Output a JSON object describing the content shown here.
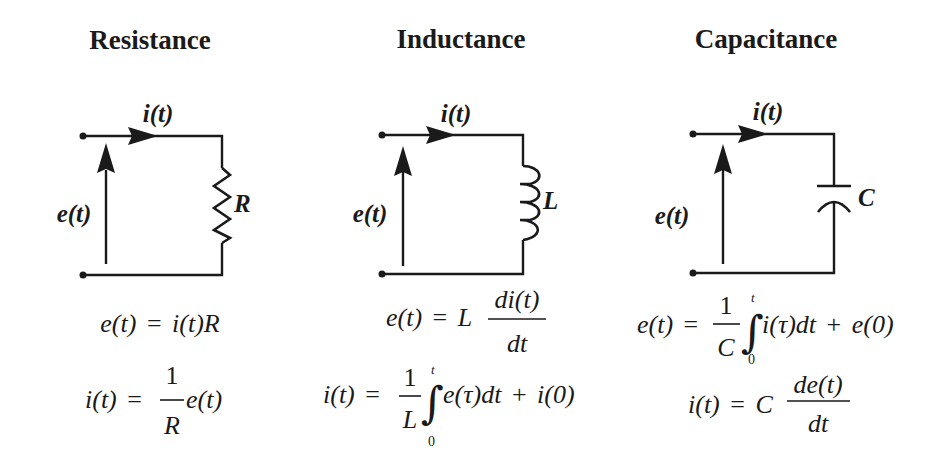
{
  "panels": [
    {
      "id": "resistance",
      "title": "Resistance",
      "current_label": "i(t)",
      "voltage_label": "e(t)",
      "component": "resistor",
      "component_label": "R",
      "equations": [
        {
          "lhs": "e(t)",
          "eq": "=",
          "rhs": "i(t)R"
        },
        {
          "lhs": "i(t)",
          "eq": "=",
          "frac_num": "1",
          "frac_den": "R",
          "rhs": "e(t)"
        }
      ]
    },
    {
      "id": "inductance",
      "title": "Inductance",
      "current_label": "i(t)",
      "voltage_label": "e(t)",
      "component": "inductor",
      "component_label": "L",
      "equations": [
        {
          "lhs": "e(t)",
          "eq": "=",
          "coef": "L",
          "frac_num": "di(t)",
          "frac_den": "dt"
        },
        {
          "lhs": "i(t)",
          "eq": "=",
          "frac_num": "1",
          "frac_den": "L",
          "integral": "∫",
          "upper": "t",
          "lower": "0",
          "integrand": "e(τ)dt",
          "plus": "+",
          "const": "i(0)"
        }
      ]
    },
    {
      "id": "capacitance",
      "title": "Capacitance",
      "current_label": "i(t)",
      "voltage_label": "e(t)",
      "component": "capacitor",
      "component_label": "C",
      "equations": [
        {
          "lhs": "e(t)",
          "eq": "=",
          "frac_num": "1",
          "frac_den": "C",
          "integral": "∫",
          "upper": "t",
          "lower": "0",
          "integrand": "i(τ)dt",
          "plus": "+",
          "const": "e(0)"
        },
        {
          "lhs": "i(t)",
          "eq": "=",
          "coef": "C",
          "frac_num": "de(t)",
          "frac_den": "dt"
        }
      ]
    }
  ],
  "colors": {
    "ink": "#1a1a1a",
    "background": "#ffffff"
  }
}
